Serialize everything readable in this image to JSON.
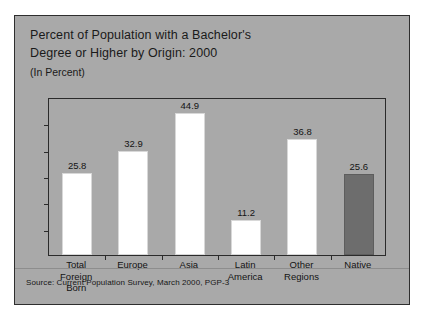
{
  "figure": {
    "title_line_1": "Percent of Population with a Bachelor's",
    "title_line_2": "Degree or Higher by Origin: 2000",
    "subtitle": "(In Percent)",
    "source": "Source: Current Population Survey, March 2000, PGP-3",
    "panel_color": "#a9a9a9",
    "bar_white": "#ffffff",
    "bar_gray": "#6d6d6d",
    "frame_color": "#2b2b2b"
  },
  "chart_data": {
    "type": "bar",
    "title": "Percent of Population with a Bachelor's Degree or Higher by Origin: 2000",
    "subtitle": "(In Percent)",
    "xlabel": "",
    "ylabel": "",
    "ylim": [
      0,
      50
    ],
    "grid": false,
    "legend": "none",
    "y_tick_count": 5,
    "categories": [
      "Total Foreign Born",
      "Europe",
      "Asia",
      "Latin America",
      "Other Regions",
      "Native"
    ],
    "category_lines": [
      [
        "Total",
        "Foreign",
        "Born"
      ],
      [
        "Europe"
      ],
      [
        "Asia"
      ],
      [
        "Latin",
        "America"
      ],
      [
        "Other",
        "Regions"
      ],
      [
        "Native"
      ]
    ],
    "values": [
      25.8,
      32.9,
      44.9,
      11.2,
      36.8,
      25.6
    ],
    "value_labels": [
      "25.8",
      "32.9",
      "44.9",
      "11.2",
      "36.8",
      "25.6"
    ],
    "bar_colors": [
      "#ffffff",
      "#ffffff",
      "#ffffff",
      "#ffffff",
      "#ffffff",
      "#6d6d6d"
    ],
    "source": "Source: Current Population Survey, March 2000, PGP-3"
  }
}
